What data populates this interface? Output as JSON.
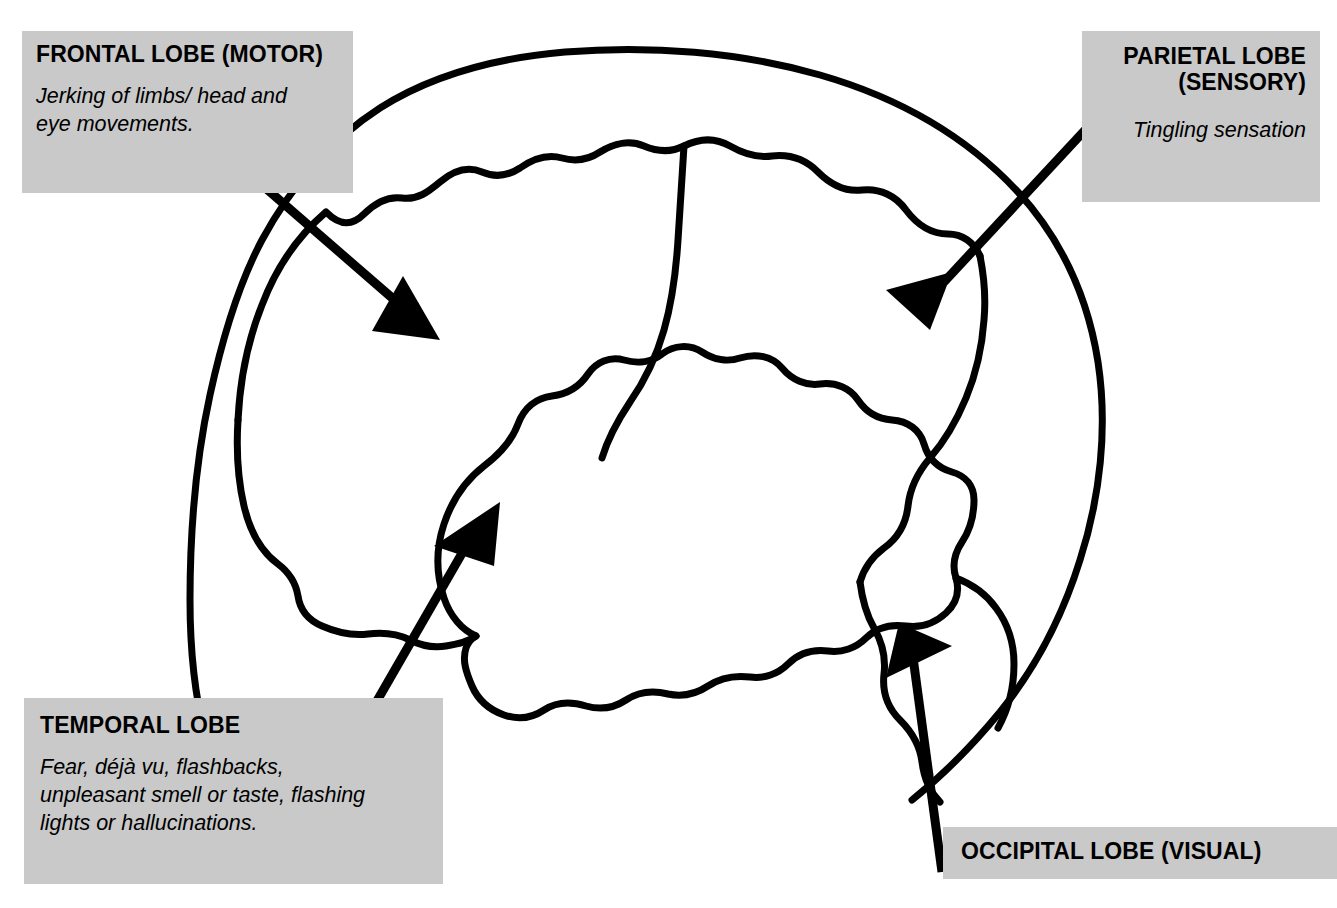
{
  "diagram": {
    "colors": {
      "label_background": "#c9c9c9",
      "ink": "#000000",
      "page_background": "#ffffff"
    }
  },
  "callouts": {
    "frontal": {
      "title": "FRONTAL LOBE (MOTOR)",
      "body_line1": "Jerking of limbs/ head and",
      "body_line2": "eye movements."
    },
    "parietal": {
      "title_line1": "PARIETAL LOBE",
      "title_line2": "(SENSORY)",
      "body_line1": "Tingling sensation"
    },
    "temporal": {
      "title": "TEMPORAL LOBE",
      "body_line1": "Fear, déjà vu, flashbacks,",
      "body_line2": "unpleasant smell or taste, flashing",
      "body_line3": "lights or hallucinations."
    },
    "occipital": {
      "title": "OCCIPITAL LOBE (VISUAL)"
    }
  }
}
